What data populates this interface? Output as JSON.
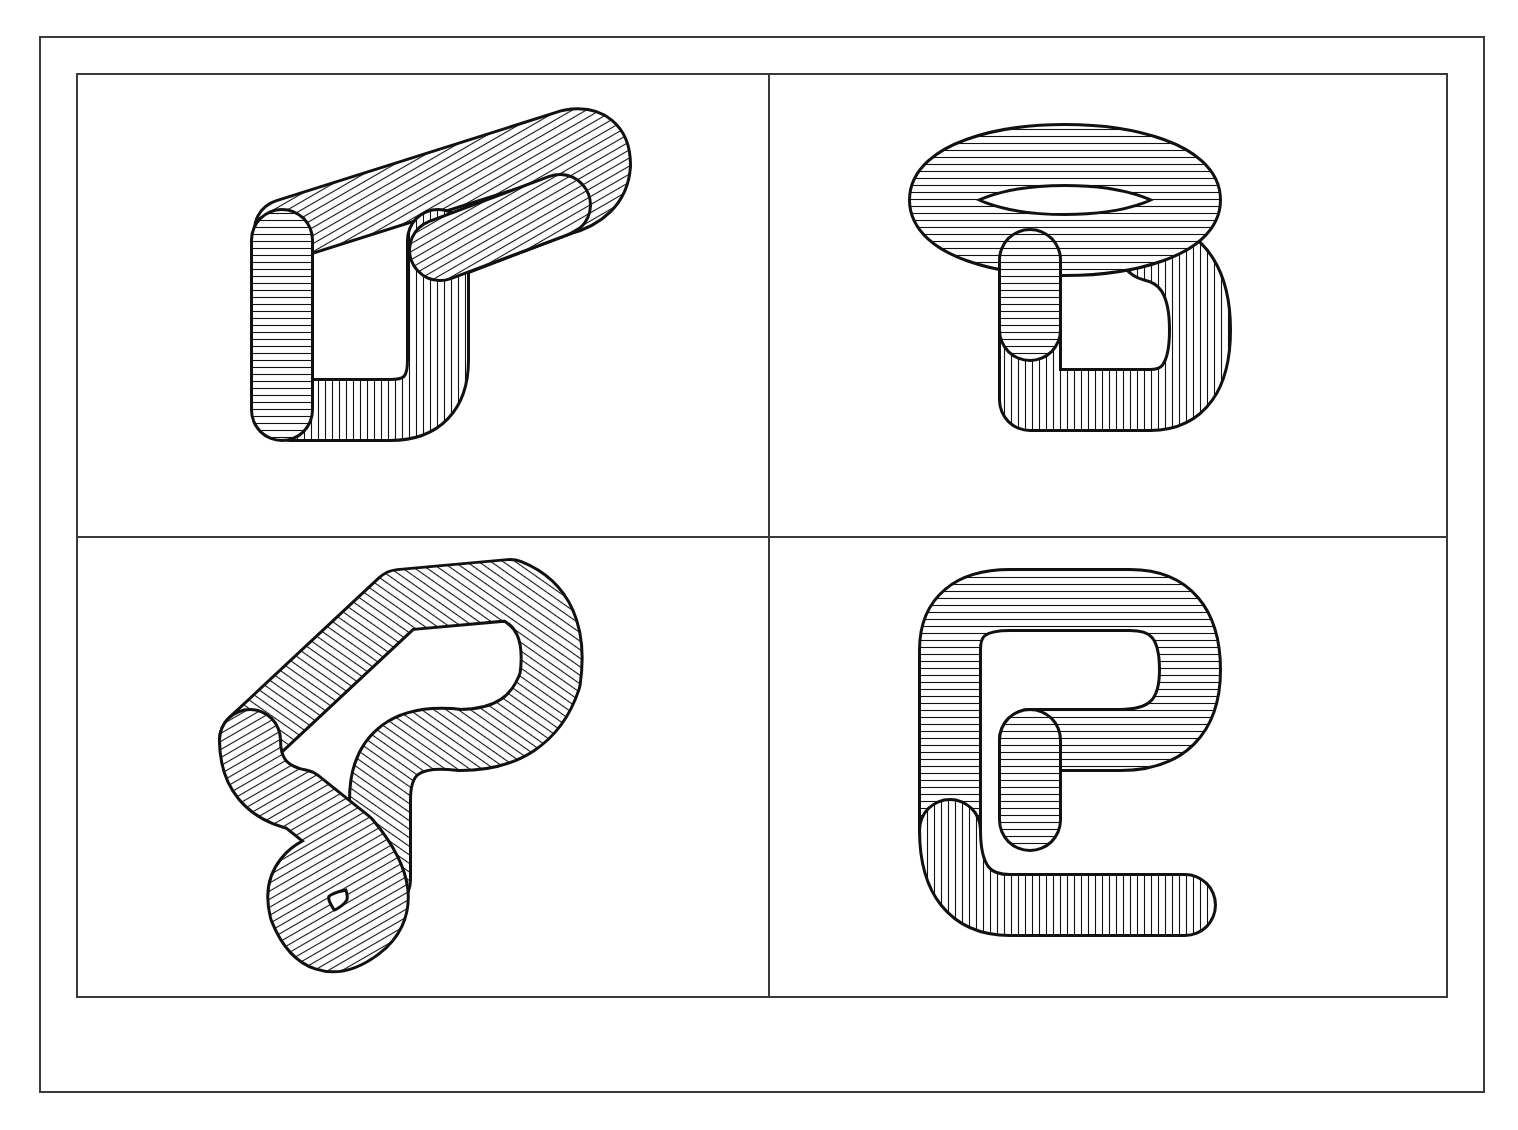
{
  "figure": {
    "layout": "2x2 grid",
    "stroke_color": "#1a1a1a",
    "background": "#ffffff",
    "panels": [
      {
        "position": "top-left",
        "description": "wireframe tube knot shaped like a hook/loop"
      },
      {
        "position": "top-right",
        "description": "wireframe tube knot shaped like a figure-eight loop"
      },
      {
        "position": "bottom-left",
        "description": "wireframe tube knot with twisted loop"
      },
      {
        "position": "bottom-right",
        "description": "wireframe tube knot shaped like a hook"
      }
    ]
  }
}
